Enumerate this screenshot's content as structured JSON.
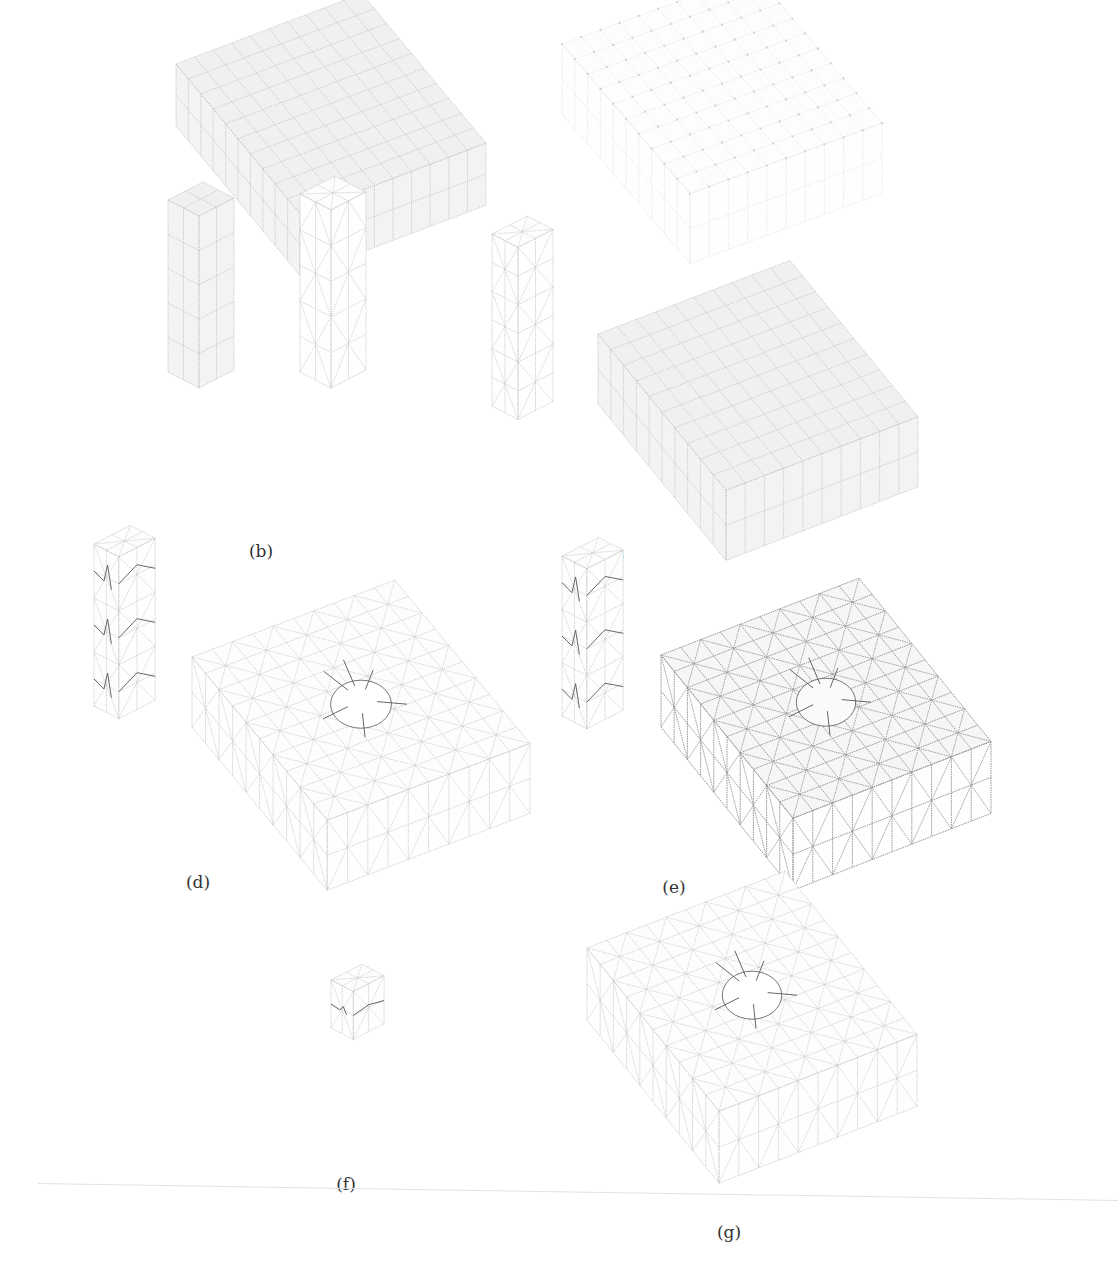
{
  "figure": {
    "labels": {
      "a": "(a)",
      "b": "(b)",
      "c": "(c)",
      "d": "(d)",
      "e": "(e)",
      "f": "(f)",
      "g": "(g)"
    },
    "colors": {
      "background": "#ffffff",
      "mesh_line_light": "#c8c8c8",
      "mesh_line_dark": "#8c8c8c",
      "face_fill_shaded": "#f1f1f1",
      "crack_line": "#555555",
      "label_text": "#333333"
    },
    "meshes": [
      {
        "id": "a-left",
        "panel": "a",
        "type": "slab",
        "nx": 10,
        "ny": 10,
        "nz": 2,
        "style": "hex-shaded",
        "diagonals": false,
        "hole": false
      },
      {
        "id": "a-right",
        "panel": "a",
        "type": "slab",
        "nx": 10,
        "ny": 10,
        "nz": 2,
        "style": "node-dots-faint",
        "diagonals": false,
        "hole": false
      },
      {
        "id": "b-left",
        "panel": "b",
        "type": "column",
        "nx": 2,
        "ny": 2,
        "nz": 5,
        "style": "hex-shaded",
        "diagonals": false
      },
      {
        "id": "b-right",
        "panel": "b",
        "type": "column",
        "nx": 2,
        "ny": 2,
        "nz": 5,
        "style": "tet-wire",
        "diagonals": true
      },
      {
        "id": "c-left",
        "panel": "c",
        "type": "column",
        "nx": 2,
        "ny": 2,
        "nz": 6,
        "style": "tet-wire",
        "diagonals": true
      },
      {
        "id": "c-right",
        "panel": "c",
        "type": "slab",
        "nx": 10,
        "ny": 10,
        "nz": 2,
        "style": "hex-shaded",
        "diagonals": false,
        "hole": false
      },
      {
        "id": "d-left",
        "panel": "d",
        "type": "column",
        "nx": 2,
        "ny": 2,
        "nz": 6,
        "style": "tet-wire-cracked",
        "diagonals": true
      },
      {
        "id": "d-right",
        "panel": "d",
        "type": "slab",
        "nx": 10,
        "ny": 10,
        "nz": 2,
        "style": "tet-wire",
        "diagonals": true,
        "hole": true
      },
      {
        "id": "e-left",
        "panel": "e",
        "type": "column",
        "nx": 2,
        "ny": 2,
        "nz": 6,
        "style": "tet-wire-cracked",
        "diagonals": true
      },
      {
        "id": "e-right",
        "panel": "e",
        "type": "slab",
        "nx": 10,
        "ny": 10,
        "nz": 2,
        "style": "tet-wire-dark",
        "diagonals": true,
        "hole": true
      },
      {
        "id": "f",
        "panel": "f",
        "type": "block",
        "nx": 2,
        "ny": 2,
        "nz": 2,
        "style": "tet-wire-cracked",
        "diagonals": true
      },
      {
        "id": "g",
        "panel": "g",
        "type": "slab",
        "nx": 10,
        "ny": 10,
        "nz": 2,
        "style": "tet-wire",
        "diagonals": true,
        "hole": true
      }
    ]
  }
}
